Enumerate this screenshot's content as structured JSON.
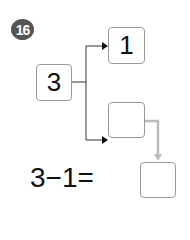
{
  "problem": {
    "number": "16",
    "whole": "3",
    "part_a": "1",
    "part_b": "",
    "equation_text": "3−1=",
    "answer": ""
  }
}
